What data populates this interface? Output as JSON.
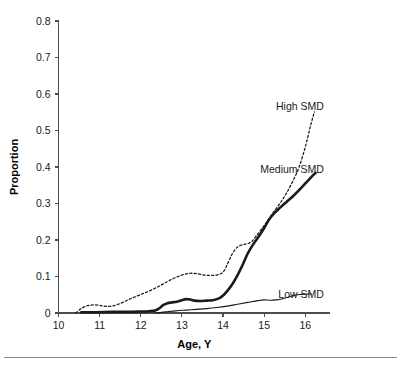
{
  "chart_data": {
    "type": "line",
    "title": "",
    "xlabel": "Age, Y",
    "ylabel": "Proportion",
    "xlim": [
      10,
      16.6
    ],
    "ylim": [
      0,
      0.8
    ],
    "xticks": [
      10,
      11,
      12,
      13,
      14,
      15,
      16
    ],
    "xtick_labels": [
      "10",
      "11",
      "12",
      "13",
      "14",
      "15",
      "16"
    ],
    "yticks": [
      0,
      0.1,
      0.2,
      0.3,
      0.4,
      0.5,
      0.6,
      0.7,
      0.8
    ],
    "ytick_labels": [
      "0",
      "0.1",
      "0.2",
      "0.3",
      "0.4",
      "0.5",
      "0.6",
      "0.7",
      "0.8"
    ],
    "grid": false,
    "legend_position": "right-inline-annotations",
    "series": [
      {
        "name": "High SMD",
        "style": "dashed",
        "label": "High SMD",
        "label_x": 16.45,
        "label_y": 0.565,
        "x": [
          10.42,
          10.55,
          10.7,
          10.85,
          11.0,
          11.15,
          11.3,
          11.45,
          11.6,
          11.75,
          11.9,
          12.05,
          12.2,
          12.35,
          12.5,
          12.65,
          12.8,
          12.95,
          13.1,
          13.25,
          13.4,
          13.55,
          13.7,
          13.85,
          14.0,
          14.1,
          14.2,
          14.3,
          14.4,
          14.5,
          14.6,
          14.7,
          14.8,
          14.95,
          15.1,
          15.25,
          15.4,
          15.55,
          15.7,
          15.85,
          16.0,
          16.12,
          16.22
        ],
        "y": [
          0.0,
          0.012,
          0.02,
          0.022,
          0.021,
          0.018,
          0.019,
          0.024,
          0.031,
          0.039,
          0.046,
          0.053,
          0.06,
          0.068,
          0.077,
          0.086,
          0.095,
          0.102,
          0.107,
          0.109,
          0.107,
          0.104,
          0.103,
          0.104,
          0.112,
          0.132,
          0.157,
          0.175,
          0.184,
          0.188,
          0.19,
          0.196,
          0.21,
          0.232,
          0.256,
          0.28,
          0.303,
          0.33,
          0.362,
          0.4,
          0.455,
          0.51,
          0.551
        ]
      },
      {
        "name": "Medium SMD",
        "style": "solid-thick",
        "label": "Medium SMD",
        "label_x": 16.45,
        "label_y": 0.392,
        "x": [
          10.55,
          10.9,
          11.3,
          11.7,
          12.0,
          12.2,
          12.35,
          12.45,
          12.55,
          12.65,
          12.75,
          12.88,
          13.0,
          13.1,
          13.2,
          13.3,
          13.45,
          13.6,
          13.75,
          13.9,
          14.0,
          14.1,
          14.22,
          14.35,
          14.48,
          14.6,
          14.72,
          14.85,
          15.0,
          15.12,
          15.25,
          15.4,
          15.55,
          15.7,
          15.85,
          16.0,
          16.15,
          16.25
        ],
        "y": [
          0.002,
          0.002,
          0.003,
          0.003,
          0.004,
          0.005,
          0.007,
          0.013,
          0.022,
          0.027,
          0.029,
          0.031,
          0.035,
          0.038,
          0.037,
          0.034,
          0.033,
          0.034,
          0.035,
          0.04,
          0.048,
          0.06,
          0.078,
          0.103,
          0.133,
          0.163,
          0.186,
          0.207,
          0.233,
          0.256,
          0.274,
          0.29,
          0.305,
          0.32,
          0.337,
          0.355,
          0.373,
          0.384
        ]
      },
      {
        "name": "Low SMD",
        "style": "solid-thin",
        "label": "Low SMD",
        "label_x": 16.45,
        "label_y": 0.052,
        "x": [
          12.35,
          12.6,
          12.85,
          13.1,
          13.35,
          13.6,
          13.85,
          14.1,
          14.35,
          14.6,
          14.85,
          15.0,
          15.15,
          15.3,
          15.45,
          15.6,
          15.75,
          15.9,
          16.05,
          16.15
        ],
        "y": [
          0.0,
          0.003,
          0.006,
          0.008,
          0.01,
          0.012,
          0.015,
          0.019,
          0.024,
          0.029,
          0.034,
          0.036,
          0.035,
          0.036,
          0.039,
          0.044,
          0.049,
          0.051,
          0.052,
          0.052
        ]
      }
    ]
  },
  "figure": {
    "footer_rule": true
  }
}
